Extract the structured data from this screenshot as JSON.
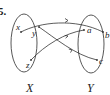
{
  "problem_number": "5.",
  "domain_set": {
    "label": "X",
    "elements": [
      "x",
      "y",
      "z"
    ]
  },
  "codomain_set": {
    "label": "Y",
    "elements": [
      "a",
      "b",
      "c"
    ]
  },
  "mappings": [
    {
      "from": "x",
      "to": "b"
    },
    {
      "from": "y",
      "to": "c"
    },
    {
      "from": "z",
      "to": "a"
    }
  ]
}
